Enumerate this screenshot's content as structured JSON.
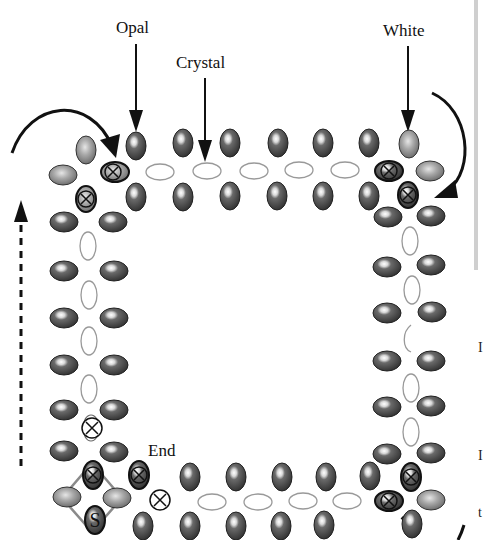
{
  "labels": {
    "opal": "Opal",
    "crystal": "Crystal",
    "white": "White",
    "end": "End",
    "start": "S"
  },
  "legend_markers": {
    "crossed_bead": "⊗"
  },
  "colors": {
    "opal_fill": "#4a4a4a",
    "opal_light": "#8a8a8a",
    "crystal_stroke": "#9a9a9a",
    "white_fill": "#9c9c9c",
    "arrow": "#111111",
    "start_square": "#8a8a8a"
  },
  "edge_text": {
    "mark1": "I",
    "mark2": "I",
    "mark3": "t"
  }
}
